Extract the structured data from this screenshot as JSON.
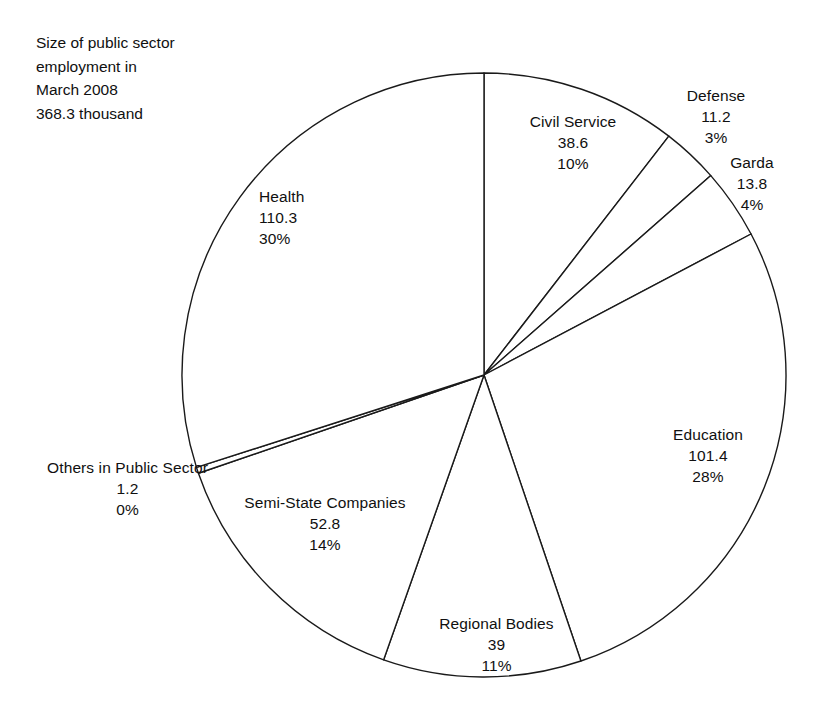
{
  "title": {
    "lines": [
      "Size of public sector",
      "employment in",
      "March 2008",
      "368.3 thousand"
    ]
  },
  "chart_data": {
    "type": "pie",
    "title": "Size of public sector employment in March 2008 368.3 thousand",
    "total": 368.3,
    "units": "thousand",
    "start_angle": 0,
    "direction": "clockwise",
    "legend": "none",
    "labels_position": "outside",
    "categories": [
      "Civil Service",
      "Defense",
      "Garda",
      "Education",
      "Regional Bodies",
      "Semi-State Companies",
      "Others in Public Sector",
      "Health"
    ],
    "values": [
      38.6,
      11.2,
      13.8,
      101.4,
      39,
      52.8,
      1.2,
      110.3
    ],
    "percents": [
      10,
      3,
      4,
      28,
      11,
      14,
      0,
      30
    ],
    "slices": [
      {
        "name": "Civil Service",
        "value": 38.6,
        "value_label": "38.6",
        "percent_label": "10%",
        "percent": 10
      },
      {
        "name": "Defense",
        "value": 11.2,
        "value_label": "11.2",
        "percent_label": "3%",
        "percent": 3
      },
      {
        "name": "Garda",
        "value": 13.8,
        "value_label": "13.8",
        "percent_label": "4%",
        "percent": 4
      },
      {
        "name": "Education",
        "value": 101.4,
        "value_label": "101.4",
        "percent_label": "28%",
        "percent": 28
      },
      {
        "name": "Regional Bodies",
        "value": 39,
        "value_label": "39",
        "percent_label": "11%",
        "percent": 11
      },
      {
        "name": "Semi-State Companies",
        "value": 52.8,
        "value_label": "52.8",
        "percent_label": "14%",
        "percent": 14
      },
      {
        "name": "Others in Public Sector",
        "value": 1.2,
        "value_label": "1.2",
        "percent_label": "0%",
        "percent": 0
      },
      {
        "name": "Health",
        "value": 110.3,
        "value_label": "110.3",
        "percent_label": "30%",
        "percent": 30
      }
    ],
    "colors": {
      "slice_fill": "#ffffff",
      "slice_stroke": "#1a1a1a",
      "text": "#101010",
      "background": "#ffffff"
    }
  }
}
